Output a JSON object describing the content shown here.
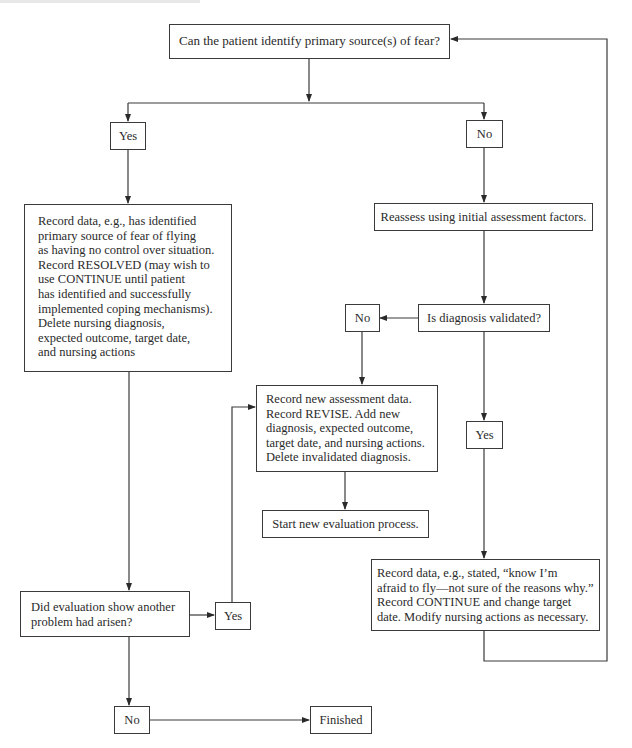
{
  "flowchart": {
    "start_question": "Can the patient identify primary source(s) of fear?",
    "branch_yes_label": "Yes",
    "branch_no_label": "No",
    "resolved_record": {
      "lines": [
        "Record data, e.g., has identified",
        "primary source of fear of flying",
        "as having no control over situation.",
        "Record RESOLVED (may wish to",
        "use CONTINUE until patient",
        "has identified and successfully",
        "implemented coping mechanisms).",
        "Delete nursing diagnosis,",
        "expected outcome, target date,",
        "and nursing actions"
      ]
    },
    "reassess_step": "Reassess using initial assessment factors.",
    "diagnosis_question": "Is diagnosis validated?",
    "diagnosis_no_label": "No",
    "diagnosis_yes_label": "Yes",
    "revise_record": {
      "lines": [
        "Record new assessment data.",
        "Record REVISE. Add new",
        "diagnosis, expected outcome,",
        "target date, and nursing actions.",
        "Delete invalidated diagnosis."
      ]
    },
    "start_new_evaluation": "Start new evaluation process.",
    "continue_record": {
      "lines": [
        "Record data, e.g., stated, “know I’m",
        "afraid to fly—not sure of the reasons why.”",
        "Record CONTINUE and change target",
        "date. Modify nursing actions as necessary."
      ]
    },
    "another_problem_question": {
      "lines": [
        "Did evaluation show another",
        "problem had arisen?"
      ]
    },
    "another_problem_yes_label": "Yes",
    "another_problem_no_label": "No",
    "end_label": "Finished"
  },
  "colors": {
    "line": "#3a3a3a",
    "text": "#2a2a2a",
    "background": "#ffffff"
  }
}
